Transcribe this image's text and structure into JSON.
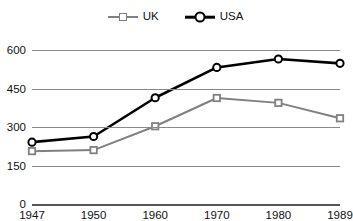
{
  "chart_data": {
    "type": "line",
    "title": "",
    "subtitle": "",
    "xlabel": "",
    "ylabel": "",
    "categories": [
      "1947",
      "1950",
      "1960",
      "1970",
      "1980",
      "1989"
    ],
    "series": [
      {
        "name": "UK",
        "color": "#808080",
        "marker": "square",
        "values": [
          206,
          210,
          303,
          413,
          394,
          334
        ]
      },
      {
        "name": "USA",
        "color": "#000000",
        "marker": "circle",
        "values": [
          241,
          263,
          414,
          532,
          565,
          548
        ]
      }
    ],
    "ylim": [
      0,
      600
    ],
    "yticks": [
      "0",
      "150",
      "300",
      "450",
      "600"
    ],
    "ytick_values": [
      0,
      150,
      300,
      450,
      600
    ],
    "xticks": [
      "1947",
      "1950",
      "1960",
      "1970",
      "1980",
      "1989"
    ],
    "grid": true,
    "grid_color": "#8a8a8a",
    "legend_position": "top-center",
    "legend": [
      "UK",
      "USA"
    ]
  },
  "legend": {
    "items": [
      {
        "label": "UK",
        "marker": "square-marker-icon"
      },
      {
        "label": "USA",
        "marker": "circle-marker-icon"
      }
    ]
  },
  "axes": {
    "y_labels": [
      "600",
      "450",
      "300",
      "150",
      "0"
    ],
    "x_labels": [
      "1947",
      "1950",
      "1960",
      "1970",
      "1980",
      "1989"
    ]
  }
}
